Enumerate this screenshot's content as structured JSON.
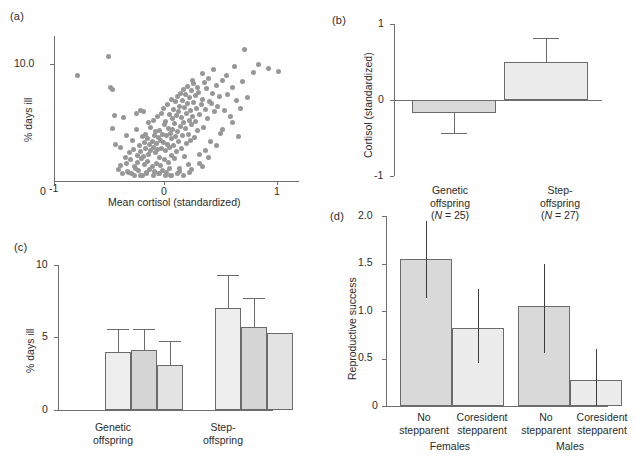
{
  "figure": {
    "panels": [
      "a",
      "b",
      "c",
      "d"
    ]
  },
  "panel_a": {
    "label": "(a)",
    "ylabel": "% days ill",
    "xlabel": "Mean cortisol (standardized)",
    "y_ticks": [
      "10.0"
    ],
    "y_origin_label": "0",
    "x_ticks": [
      "-1",
      "0",
      "1"
    ]
  },
  "panel_b": {
    "label": "(b)",
    "ylabel": "Cortisol (standardized)",
    "y_ticks": [
      "1",
      "0",
      "-1"
    ],
    "categories": [
      {
        "line1": "Genetic",
        "line2": "offspring",
        "line3_pre": "(",
        "line3_n": "N",
        "line3_post": " = 25)"
      },
      {
        "line1": "Step-",
        "line2": "offspring",
        "line3_pre": "(",
        "line3_n": "N",
        "line3_post": " = 27)"
      }
    ]
  },
  "panel_c": {
    "label": "(c)",
    "ylabel": "% days ill",
    "y_ticks": [
      "10",
      "5",
      "0"
    ],
    "groups": [
      {
        "line1": "Genetic",
        "line2": "offspring"
      },
      {
        "line1": "Step-",
        "line2": "offspring"
      }
    ]
  },
  "panel_d": {
    "label": "(d)",
    "ylabel": "Reproductive success",
    "y_ticks": [
      "2.0",
      "1.5",
      "1.0",
      "0.5",
      "0"
    ],
    "categories": [
      {
        "line1": "No",
        "line2": "stepparent"
      },
      {
        "line1": "Coresident",
        "line2": "stepparent"
      },
      {
        "line1": "No",
        "line2": "stepparent"
      },
      {
        "line1": "Coresident",
        "line2": "stepparent"
      }
    ],
    "groups": [
      "Females",
      "Males"
    ]
  },
  "colors": {
    "dot": "#979797",
    "bar_light": "#ececec",
    "bar_mid": "#d9d9d9",
    "bar_border": "#6b6b6b",
    "axis": "#6e6e6e",
    "text": "#2b2b2b"
  },
  "chart_data": [
    {
      "panel": "a",
      "type": "scatter",
      "title": "",
      "xlabel": "Mean cortisol (standardized)",
      "ylabel": "% days ill",
      "xlim": [
        -1.15,
        1.25
      ],
      "ylim_note": "log-like axis, only 10.0 tick labelled, origin labelled 0",
      "y_tick_values": [
        10.0
      ],
      "x_tick_values": [
        -1,
        0,
        1
      ],
      "grid": false,
      "legend": "none",
      "n_points": 196,
      "points": [
        [
          -0.92,
          9.0
        ],
        [
          -0.62,
          10.6
        ],
        [
          -0.6,
          8.0
        ],
        [
          -0.58,
          7.8
        ],
        [
          -0.56,
          5.6
        ],
        [
          -0.55,
          3.1
        ],
        [
          -0.5,
          1.3
        ],
        [
          -0.47,
          5.4
        ],
        [
          -0.45,
          2.0
        ],
        [
          -0.44,
          1.5
        ],
        [
          -0.42,
          0.7
        ],
        [
          -0.41,
          2.4
        ],
        [
          -0.4,
          1.8
        ],
        [
          -0.39,
          0.6
        ],
        [
          -0.38,
          3.5
        ],
        [
          -0.37,
          2.7
        ],
        [
          -0.36,
          0.5
        ],
        [
          -0.35,
          1.1
        ],
        [
          -0.34,
          4.4
        ],
        [
          -0.33,
          2.2
        ],
        [
          -0.33,
          1.6
        ],
        [
          -0.32,
          0.9
        ],
        [
          -0.31,
          3.0
        ],
        [
          -0.3,
          6.0
        ],
        [
          -0.3,
          2.5
        ],
        [
          -0.29,
          1.9
        ],
        [
          -0.28,
          3.8
        ],
        [
          -0.28,
          0.5
        ],
        [
          -0.27,
          2.1
        ],
        [
          -0.26,
          3.3
        ],
        [
          -0.26,
          1.4
        ],
        [
          -0.25,
          4.0
        ],
        [
          -0.25,
          2.8
        ],
        [
          -0.24,
          0.6
        ],
        [
          -0.23,
          3.6
        ],
        [
          -0.23,
          1.7
        ],
        [
          -0.22,
          5.0
        ],
        [
          -0.22,
          2.3
        ],
        [
          -0.21,
          3.1
        ],
        [
          -0.21,
          1.0
        ],
        [
          -0.2,
          4.6
        ],
        [
          -0.2,
          2.6
        ],
        [
          -0.19,
          3.4
        ],
        [
          -0.19,
          1.2
        ],
        [
          -0.18,
          5.2
        ],
        [
          -0.18,
          2.9
        ],
        [
          -0.17,
          3.9
        ],
        [
          -0.17,
          0.8
        ],
        [
          -0.16,
          4.2
        ],
        [
          -0.16,
          2.4
        ],
        [
          -0.15,
          3.2
        ],
        [
          -0.15,
          1.5
        ],
        [
          -0.14,
          5.5
        ],
        [
          -0.14,
          2.7
        ],
        [
          -0.13,
          3.7
        ],
        [
          -0.13,
          0.6
        ],
        [
          -0.12,
          4.3
        ],
        [
          -0.12,
          2.0
        ],
        [
          -0.11,
          3.5
        ],
        [
          -0.11,
          1.3
        ],
        [
          -0.1,
          5.8
        ],
        [
          -0.1,
          2.8
        ],
        [
          -0.09,
          4.0
        ],
        [
          -0.09,
          0.9
        ],
        [
          -0.08,
          6.2
        ],
        [
          -0.08,
          3.3
        ],
        [
          -0.07,
          4.8
        ],
        [
          -0.07,
          1.8
        ],
        [
          -0.06,
          5.1
        ],
        [
          -0.06,
          2.6
        ],
        [
          -0.05,
          3.9
        ],
        [
          -0.05,
          0.7
        ],
        [
          -0.04,
          6.5
        ],
        [
          -0.04,
          3.1
        ],
        [
          -0.03,
          4.5
        ],
        [
          -0.03,
          1.6
        ],
        [
          -0.02,
          5.7
        ],
        [
          -0.02,
          2.9
        ],
        [
          -0.01,
          4.1
        ],
        [
          -0.01,
          0.5
        ],
        [
          0.0,
          7.0
        ],
        [
          0.0,
          3.6
        ],
        [
          0.0,
          2.2
        ],
        [
          0.01,
          5.3
        ],
        [
          0.01,
          4.4
        ],
        [
          0.02,
          6.1
        ],
        [
          0.02,
          3.0
        ],
        [
          0.03,
          4.9
        ],
        [
          0.03,
          1.9
        ],
        [
          0.04,
          6.8
        ],
        [
          0.04,
          3.8
        ],
        [
          0.05,
          5.6
        ],
        [
          0.05,
          2.5
        ],
        [
          0.06,
          7.2
        ],
        [
          0.06,
          4.2
        ],
        [
          0.07,
          5.9
        ],
        [
          0.07,
          3.4
        ],
        [
          0.08,
          6.4
        ],
        [
          0.08,
          1.1
        ],
        [
          0.09,
          7.5
        ],
        [
          0.09,
          4.7
        ],
        [
          0.1,
          5.4
        ],
        [
          0.1,
          2.8
        ],
        [
          0.11,
          6.9
        ],
        [
          0.11,
          3.9
        ],
        [
          0.12,
          7.8
        ],
        [
          0.12,
          5.0
        ],
        [
          0.13,
          6.3
        ],
        [
          0.13,
          2.1
        ],
        [
          0.14,
          7.4
        ],
        [
          0.14,
          4.5
        ],
        [
          0.15,
          5.8
        ],
        [
          0.15,
          3.2
        ],
        [
          0.16,
          8.1
        ],
        [
          0.16,
          6.6
        ],
        [
          0.17,
          4.0
        ],
        [
          0.17,
          1.4
        ],
        [
          0.18,
          7.1
        ],
        [
          0.18,
          5.2
        ],
        [
          0.19,
          6.0
        ],
        [
          0.19,
          3.5
        ],
        [
          0.2,
          7.7
        ],
        [
          0.2,
          4.8
        ],
        [
          0.21,
          5.5
        ],
        [
          0.22,
          8.3
        ],
        [
          0.22,
          6.7
        ],
        [
          0.23,
          3.7
        ],
        [
          0.24,
          7.3
        ],
        [
          0.24,
          5.1
        ],
        [
          0.25,
          6.2
        ],
        [
          0.26,
          8.0
        ],
        [
          0.26,
          4.3
        ],
        [
          0.27,
          7.6
        ],
        [
          0.28,
          5.7
        ],
        [
          0.28,
          2.3
        ],
        [
          0.29,
          6.5
        ],
        [
          0.3,
          9.2
        ],
        [
          0.3,
          7.0
        ],
        [
          0.31,
          4.6
        ],
        [
          0.32,
          8.4
        ],
        [
          0.33,
          6.1
        ],
        [
          0.34,
          7.9
        ],
        [
          0.35,
          5.3
        ],
        [
          0.36,
          8.8
        ],
        [
          0.37,
          6.8
        ],
        [
          0.38,
          3.4
        ],
        [
          0.4,
          7.5
        ],
        [
          0.41,
          9.5
        ],
        [
          0.42,
          5.9
        ],
        [
          0.44,
          8.2
        ],
        [
          0.45,
          6.4
        ],
        [
          0.47,
          7.2
        ],
        [
          0.48,
          4.1
        ],
        [
          0.5,
          8.6
        ],
        [
          0.52,
          6.0
        ],
        [
          0.54,
          9.0
        ],
        [
          0.55,
          7.4
        ],
        [
          0.58,
          5.5
        ],
        [
          0.6,
          8.0
        ],
        [
          0.62,
          9.8
        ],
        [
          0.64,
          6.9
        ],
        [
          0.66,
          3.8
        ],
        [
          0.7,
          8.5
        ],
        [
          0.72,
          11.2
        ],
        [
          0.75,
          7.1
        ],
        [
          0.8,
          9.3
        ],
        [
          0.85,
          10.0
        ],
        [
          0.95,
          9.6
        ],
        [
          1.05,
          9.4
        ],
        [
          -0.52,
          1.0
        ],
        [
          -0.48,
          0.6
        ],
        [
          -0.43,
          0.8
        ],
        [
          -0.36,
          1.2
        ],
        [
          -0.3,
          0.5
        ],
        [
          -0.24,
          0.7
        ],
        [
          -0.18,
          0.5
        ],
        [
          -0.12,
          0.6
        ],
        [
          -0.06,
          0.5
        ],
        [
          0.0,
          0.5
        ],
        [
          0.06,
          0.6
        ],
        [
          0.12,
          0.5
        ],
        [
          0.18,
          0.7
        ],
        [
          -0.58,
          4.5
        ],
        [
          -0.34,
          5.8
        ],
        [
          0.33,
          2.6
        ],
        [
          0.44,
          3.0
        ],
        [
          0.2,
          1.0
        ],
        [
          -0.02,
          1.1
        ],
        [
          0.28,
          1.5
        ],
        [
          0.36,
          2.0
        ],
        [
          -0.5,
          2.9
        ],
        [
          0.6,
          5.0
        ],
        [
          0.39,
          6.6
        ],
        [
          0.21,
          8.6
        ],
        [
          -0.44,
          3.9
        ],
        [
          0.08,
          0.8
        ],
        [
          0.5,
          4.4
        ],
        [
          0.68,
          6.2
        ],
        [
          0.3,
          1.2
        ],
        [
          -0.27,
          5.9
        ]
      ]
    },
    {
      "panel": "b",
      "type": "bar",
      "title": "",
      "xlabel": "",
      "ylabel": "Cortisol (standardized)",
      "categories": [
        "Genetic offspring (N = 25)",
        "Step-offspring (N = 27)"
      ],
      "values": [
        -0.17,
        0.5
      ],
      "errors_low": [
        -0.43,
        0.5
      ],
      "errors_high": [
        -0.17,
        0.82
      ],
      "ylim": [
        -1,
        1
      ],
      "y_tick_values": [
        1,
        0,
        -1
      ],
      "grid": false,
      "legend": "none",
      "sample_sizes": [
        25,
        27
      ]
    },
    {
      "panel": "c",
      "type": "bar",
      "title": "",
      "xlabel": "",
      "ylabel": "% days ill",
      "categories": [
        "Genetic offspring",
        "Step-offspring"
      ],
      "series": [
        {
          "name": "bar 1",
          "values": [
            4.3,
            7.6
          ]
        },
        {
          "name": "bar 2",
          "values": [
            4.5,
            6.2
          ]
        },
        {
          "name": "bar 3",
          "values": [
            3.35,
            5.7
          ]
        }
      ],
      "error_high": [
        [
          6.0,
          10.05
        ],
        [
          6.0,
          8.35
        ],
        [
          5.15,
          null
        ]
      ],
      "ylim": [
        0,
        10.8
      ],
      "y_tick_values": [
        0,
        5,
        10
      ],
      "grid": false,
      "legend": "none"
    },
    {
      "panel": "d",
      "type": "bar",
      "title": "",
      "xlabel": "",
      "ylabel": "Reproductive success",
      "categories": [
        "No stepparent",
        "Coresident stepparent",
        "No stepparent",
        "Coresident stepparent"
      ],
      "groups": [
        "Females",
        "Females",
        "Males",
        "Males"
      ],
      "values": [
        1.62,
        0.86,
        1.11,
        0.29
      ],
      "error_low": [
        1.19,
        0.48,
        0.59,
        0.0
      ],
      "error_high": [
        2.05,
        1.29,
        1.57,
        0.63
      ],
      "ylim": [
        0,
        2.1
      ],
      "y_tick_values": [
        0,
        0.5,
        1.0,
        1.5,
        2.0
      ],
      "grid": false,
      "legend": "none"
    }
  ]
}
